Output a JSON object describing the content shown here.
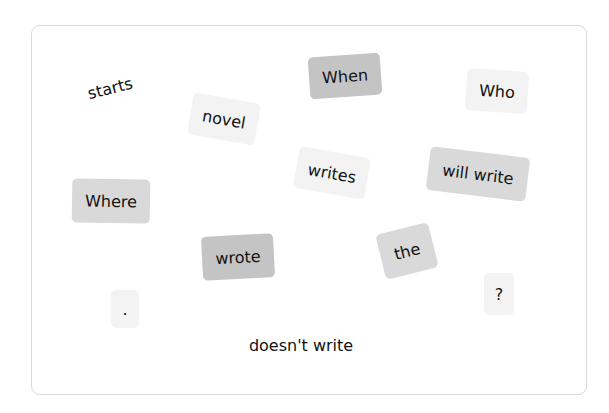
{
  "tiles": [
    {
      "text": "starts",
      "style": "plain"
    },
    {
      "text": "When",
      "style": "dark"
    },
    {
      "text": "Who",
      "style": "light"
    },
    {
      "text": "novel",
      "style": "light"
    },
    {
      "text": "writes",
      "style": "light"
    },
    {
      "text": "will write",
      "style": "mid"
    },
    {
      "text": "Where",
      "style": "mid"
    },
    {
      "text": "wrote",
      "style": "dark"
    },
    {
      "text": "the",
      "style": "mid"
    },
    {
      "text": ".",
      "style": "light"
    },
    {
      "text": "?",
      "style": "light"
    },
    {
      "text": "doesn't write",
      "style": "plain"
    }
  ]
}
